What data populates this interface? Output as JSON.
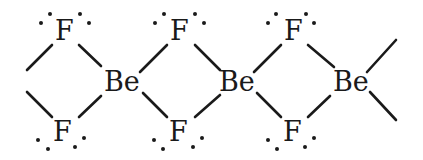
{
  "diagram": {
    "atoms": [
      {
        "id": "F1",
        "label": "F",
        "x": 65,
        "y": 40
      },
      {
        "id": "F2",
        "label": "F",
        "x": 180,
        "y": 40
      },
      {
        "id": "F3",
        "label": "F",
        "x": 294,
        "y": 40
      },
      {
        "id": "F4",
        "label": "F",
        "x": 63,
        "y": 141
      },
      {
        "id": "F5",
        "label": "F",
        "x": 179,
        "y": 141
      },
      {
        "id": "F6",
        "label": "F",
        "x": 293,
        "y": 141
      },
      {
        "id": "Be1",
        "label": "Be",
        "x": 122,
        "y": 91
      },
      {
        "id": "Be2",
        "label": "Be",
        "x": 237,
        "y": 91
      },
      {
        "id": "Be3",
        "label": "Be",
        "x": 352,
        "y": 91
      }
    ],
    "labels": {
      "fluorine": "F",
      "beryllium": "Be"
    }
  }
}
